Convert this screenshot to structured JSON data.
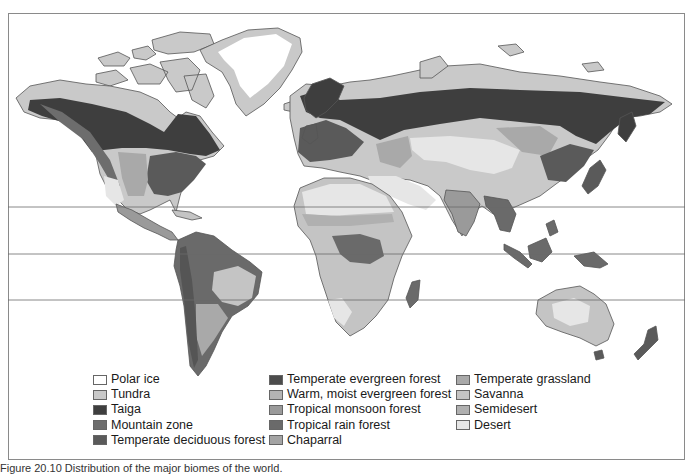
{
  "figure": {
    "caption": "Figure 20.10 Distribution of the major biomes of the world.",
    "latitude_lines_y": [
      207,
      254,
      300
    ]
  },
  "colors": {
    "polar_ice": "#ffffff",
    "tundra": "#c9c9c9",
    "taiga": "#3e3e3e",
    "mountain_zone": "#6d6d6d",
    "temperate_deciduous_forest": "#5a5a5a",
    "temperate_evergreen_forest": "#4c4c4c",
    "warm_moist_evergreen_forest": "#b4b4b4",
    "tropical_monsoon_forest": "#9a9a9a",
    "tropical_rain_forest": "#6a6a6a",
    "chaparral": "#a4a4a4",
    "temperate_grassland": "#a9a9a9",
    "savanna": "#c4c4c4",
    "semidesert": "#b0b0b0",
    "desert": "#e6e6e6",
    "outline": "#555555",
    "frame": "#8a8a8a"
  },
  "legend": {
    "columns": [
      [
        {
          "label": "Polar ice",
          "color": "#ffffff"
        },
        {
          "label": "Tundra",
          "color": "#c9c9c9"
        },
        {
          "label": "Taiga",
          "color": "#3e3e3e"
        },
        {
          "label": "Mountain zone",
          "color": "#6d6d6d"
        },
        {
          "label": "Temperate deciduous forest",
          "color": "#5a5a5a"
        }
      ],
      [
        {
          "label": "Temperate evergreen forest",
          "color": "#4c4c4c"
        },
        {
          "label": "Warm, moist evergreen forest",
          "color": "#b4b4b4"
        },
        {
          "label": "Tropical monsoon forest",
          "color": "#9a9a9a"
        },
        {
          "label": "Tropical rain forest",
          "color": "#6a6a6a"
        },
        {
          "label": "Chaparral",
          "color": "#a4a4a4"
        }
      ],
      [
        {
          "label": "Temperate grassland",
          "color": "#a9a9a9"
        },
        {
          "label": "Savanna",
          "color": "#c4c4c4"
        },
        {
          "label": "Semidesert",
          "color": "#b0b0b0"
        },
        {
          "label": "Desert",
          "color": "#e6e6e6"
        }
      ]
    ]
  }
}
